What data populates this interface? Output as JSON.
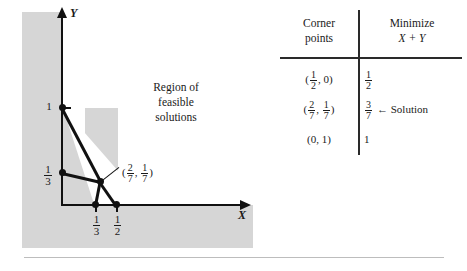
{
  "graph": {
    "y_axis_label": "Y",
    "x_axis_label": "X",
    "region_label_line1": "Region of",
    "region_label_line2": "feasible",
    "region_label_line3": "solutions",
    "y_tick_1": "1",
    "y_tick_third_num": "1",
    "y_tick_third_den": "3",
    "x_tick_third_num": "1",
    "x_tick_third_den": "3",
    "x_tick_half_num": "1",
    "x_tick_half_den": "2",
    "corner_label_open": "(",
    "corner_label_x_num": "2",
    "corner_label_x_den": "7",
    "corner_label_comma": ",",
    "corner_label_y_num": "1",
    "corner_label_y_den": "7",
    "corner_label_close": ")",
    "shade_color": "#d6d6d6",
    "line_color": "#111111"
  },
  "table": {
    "header_left_line1": "Corner",
    "header_left_line2": "points",
    "header_right_line1": "Minimize",
    "header_right_line2": "X + Y",
    "rows": [
      {
        "point_open": "(",
        "point_x_num": "1",
        "point_x_den": "2",
        "point_comma": ",",
        "point_y": "0",
        "point_close": ")",
        "value_num": "1",
        "value_den": "2",
        "value_whole": "",
        "annotation": ""
      },
      {
        "point_open": "(",
        "point_x_num": "2",
        "point_x_den": "7",
        "point_comma": ",",
        "point_y_num": "1",
        "point_y_den": "7",
        "point_close": ")",
        "value_num": "3",
        "value_den": "7",
        "value_whole": "",
        "annotation": "← Solution"
      },
      {
        "point_text": "(0, 1)",
        "value_whole": "1",
        "annotation": ""
      }
    ]
  }
}
